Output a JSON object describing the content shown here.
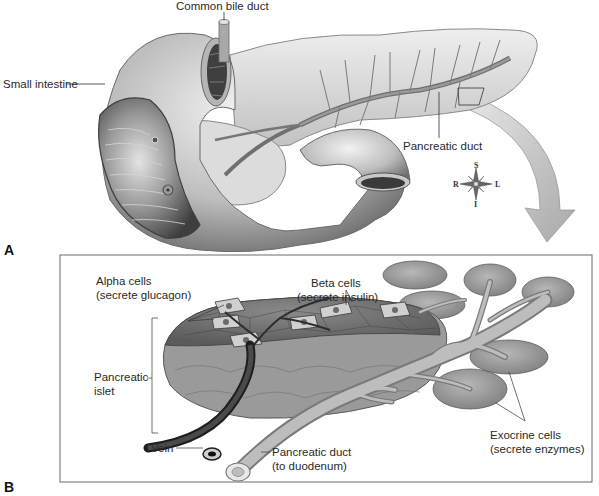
{
  "figure": {
    "panels": [
      {
        "id": "A",
        "label": "A",
        "labels": {
          "common_bile_duct": "Common bile duct",
          "small_intestine": "Small intestine",
          "pancreatic_duct": "Pancreatic duct"
        },
        "compass": {
          "superior": "S",
          "inferior": "I",
          "right": "R",
          "left": "L"
        }
      },
      {
        "id": "B",
        "label": "B",
        "labels": {
          "alpha_cells_1": "Alpha cells",
          "alpha_cells_2": "(secrete glucagon)",
          "beta_cells_1": "Beta cells",
          "beta_cells_2": "(secrete insulin)",
          "pancreatic_islet_1": "Pancreatic",
          "pancreatic_islet_2": "islet",
          "vein": "Vein",
          "pancreatic_duct_1": "Pancreatic duct",
          "pancreatic_duct_2": "(to duodenum)",
          "exocrine_cells_1": "Exocrine cells",
          "exocrine_cells_2": "(secrete enzymes)"
        }
      }
    ],
    "colors": {
      "tissue_light": "#d8d8d8",
      "tissue_mid": "#9a9a9a",
      "tissue_dark": "#5a5a5a",
      "duct": "#888888",
      "arrow": "#b5b5b5",
      "frame": "#555555"
    }
  }
}
